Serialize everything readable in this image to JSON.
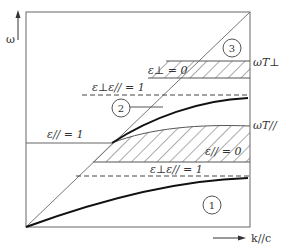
{
  "diagram": {
    "type": "dispersion-diagram",
    "axes": {
      "y_label": "ω",
      "x_label": "k//c"
    },
    "regions": [
      {
        "id": "1",
        "label": "1"
      },
      {
        "id": "2",
        "label": "2"
      },
      {
        "id": "3",
        "label": "3"
      }
    ],
    "annotations": {
      "eps_perp_zero": "ε⊥ = 0",
      "eps_par_zero": "ε// = 0",
      "eps_par_one": "ε// = 1",
      "eps_product_upper": "ε⊥ε// = 1",
      "eps_product_lower": "ε⊥ε// = 1",
      "omega_T_perp": "ωT⊥",
      "omega_T_par": "ωT//"
    },
    "colors": {
      "line": "#555555",
      "thick_curve": "#111111",
      "background": "#ffffff"
    }
  }
}
